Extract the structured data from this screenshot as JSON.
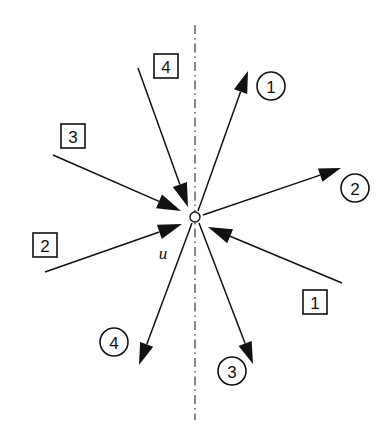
{
  "figure": {
    "center_label": "u",
    "background_color": "#ffffff",
    "line_color": "#111111",
    "axis_color": "#555555"
  },
  "axis": {
    "name": "symmetry-axis",
    "style": "dash-dot",
    "orientation": "vertical",
    "x": 195,
    "y_start": 25,
    "y_end": 420
  },
  "center": {
    "name": "convergence-node",
    "x": 195,
    "y": 217,
    "radius": 5
  },
  "incoming_rays": [
    {
      "id": "in-4",
      "label": "4",
      "label_shape": "square",
      "tail_x": 138,
      "tail_y": 68,
      "head_x": 188,
      "head_y": 207,
      "label_x": 166,
      "label_y": 66
    },
    {
      "id": "in-3",
      "label": "3",
      "label_shape": "square",
      "tail_x": 53,
      "tail_y": 155,
      "head_x": 181,
      "head_y": 211,
      "label_x": 73,
      "label_y": 136
    },
    {
      "id": "in-2",
      "label": "2",
      "label_shape": "square",
      "tail_x": 45,
      "tail_y": 272,
      "head_x": 182,
      "head_y": 224,
      "label_x": 45,
      "label_y": 245
    },
    {
      "id": "in-1",
      "label": "1",
      "label_shape": "square",
      "tail_x": 342,
      "tail_y": 283,
      "head_x": 208,
      "head_y": 227,
      "label_x": 315,
      "label_y": 302
    }
  ],
  "outgoing_rays": [
    {
      "id": "out-1",
      "label": "1",
      "label_shape": "circle",
      "tail_x": 198,
      "tail_y": 211,
      "head_x": 248,
      "head_y": 71,
      "label_x": 271,
      "label_y": 86
    },
    {
      "id": "out-2",
      "label": "2",
      "label_shape": "circle",
      "tail_x": 203,
      "tail_y": 215,
      "head_x": 341,
      "head_y": 168,
      "label_x": 355,
      "label_y": 188
    },
    {
      "id": "out-3",
      "label": "3",
      "label_shape": "circle",
      "tail_x": 199,
      "tail_y": 223,
      "head_x": 253,
      "head_y": 364,
      "label_x": 232,
      "label_y": 371
    },
    {
      "id": "out-4",
      "label": "4",
      "label_shape": "circle",
      "tail_x": 192,
      "tail_y": 223,
      "head_x": 139,
      "head_y": 365,
      "label_x": 114,
      "label_y": 342
    }
  ],
  "center_variable": {
    "name": "u",
    "text": "u",
    "x": 163,
    "y": 253
  }
}
